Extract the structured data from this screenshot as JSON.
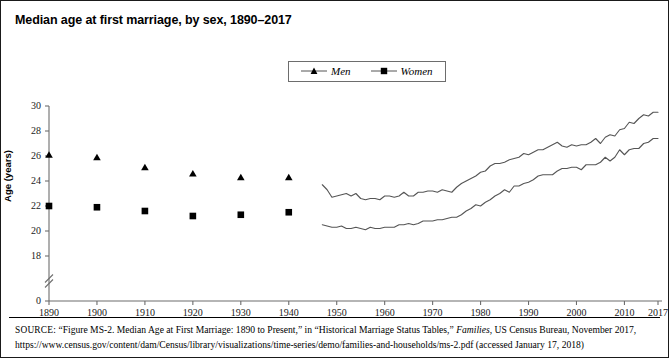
{
  "figure": {
    "title": "Median age at first marriage, by sex, 1890–2017",
    "ylabel": "Age (years)",
    "source_prefix": "SOURCE:",
    "source_text_1": " “Figure MS-2. Median Age at First Marriage: 1890 to Present,” in “Historical Marriage Status Tables,” ",
    "source_italic": "Families",
    "source_text_2": ", US Census Bureau, November 2017, https://www.census.gov/content/dam/Census/library/visualizations/time-series/demo/families-and-households/ms-2.pdf (accessed January 17, 2018)"
  },
  "legend": {
    "position": "top-center",
    "items": [
      {
        "label": "Men",
        "marker": "triangle-marker"
      },
      {
        "label": "Women",
        "marker": "square-marker"
      }
    ]
  },
  "chart_data": {
    "type": "line",
    "title": "Median age at first marriage, by sex, 1890–2017",
    "xlabel": "",
    "ylabel": "Age (years)",
    "xlim": [
      1890,
      2017
    ],
    "ylim": [
      17.5,
      30.5
    ],
    "yticks": [
      0,
      18,
      20,
      22,
      24,
      26,
      28,
      30
    ],
    "xticks": [
      1890,
      1900,
      1910,
      1920,
      1930,
      1940,
      1950,
      1960,
      1970,
      1980,
      1990,
      2000,
      2010,
      2017
    ],
    "axis_break": true,
    "axis_break_between": [
      0,
      18
    ],
    "grid": false,
    "legend_position": "top-center",
    "series": [
      {
        "name": "Men",
        "marker": "triangle",
        "style": "markers-then-line",
        "markers": {
          "x": [
            1890,
            1900,
            1910,
            1920,
            1930,
            1940
          ],
          "y": [
            26.1,
            25.9,
            25.1,
            24.6,
            24.3,
            24.3
          ]
        },
        "line": {
          "x": [
            1947,
            1948,
            1949,
            1950,
            1951,
            1952,
            1953,
            1954,
            1955,
            1956,
            1957,
            1958,
            1959,
            1960,
            1961,
            1962,
            1963,
            1964,
            1965,
            1966,
            1967,
            1968,
            1969,
            1970,
            1971,
            1972,
            1973,
            1974,
            1975,
            1976,
            1977,
            1978,
            1979,
            1980,
            1981,
            1982,
            1983,
            1984,
            1985,
            1986,
            1987,
            1988,
            1989,
            1990,
            1991,
            1992,
            1993,
            1994,
            1995,
            1996,
            1997,
            1998,
            1999,
            2000,
            2001,
            2002,
            2003,
            2004,
            2005,
            2006,
            2007,
            2008,
            2009,
            2010,
            2011,
            2012,
            2013,
            2014,
            2015,
            2016,
            2017
          ],
          "y": [
            23.7,
            23.3,
            22.7,
            22.8,
            22.9,
            23.0,
            22.8,
            23.0,
            22.6,
            22.5,
            22.6,
            22.6,
            22.5,
            22.8,
            22.8,
            22.7,
            22.8,
            23.1,
            22.8,
            22.8,
            23.1,
            23.1,
            23.2,
            23.2,
            23.1,
            23.3,
            23.2,
            23.1,
            23.5,
            23.8,
            24.0,
            24.2,
            24.4,
            24.7,
            24.8,
            25.2,
            25.4,
            25.4,
            25.5,
            25.7,
            25.8,
            25.9,
            26.2,
            26.1,
            26.3,
            26.5,
            26.5,
            26.7,
            26.9,
            27.1,
            26.8,
            26.7,
            26.9,
            26.8,
            26.9,
            26.9,
            27.1,
            27.4,
            27.0,
            27.5,
            27.7,
            27.6,
            28.1,
            28.2,
            28.7,
            28.6,
            29.0,
            29.3,
            29.2,
            29.5,
            29.5
          ]
        }
      },
      {
        "name": "Women",
        "marker": "square",
        "style": "markers-then-line",
        "markers": {
          "x": [
            1890,
            1900,
            1910,
            1920,
            1930,
            1940
          ],
          "y": [
            22.0,
            21.9,
            21.6,
            21.2,
            21.3,
            21.5
          ]
        },
        "line": {
          "x": [
            1947,
            1948,
            1949,
            1950,
            1951,
            1952,
            1953,
            1954,
            1955,
            1956,
            1957,
            1958,
            1959,
            1960,
            1961,
            1962,
            1963,
            1964,
            1965,
            1966,
            1967,
            1968,
            1969,
            1970,
            1971,
            1972,
            1973,
            1974,
            1975,
            1976,
            1977,
            1978,
            1979,
            1980,
            1981,
            1982,
            1983,
            1984,
            1985,
            1986,
            1987,
            1988,
            1989,
            1990,
            1991,
            1992,
            1993,
            1994,
            1995,
            1996,
            1997,
            1998,
            1999,
            2000,
            2001,
            2002,
            2003,
            2004,
            2005,
            2006,
            2007,
            2008,
            2009,
            2010,
            2011,
            2012,
            2013,
            2014,
            2015,
            2016,
            2017
          ],
          "y": [
            20.5,
            20.4,
            20.3,
            20.3,
            20.4,
            20.2,
            20.2,
            20.3,
            20.2,
            20.1,
            20.3,
            20.2,
            20.2,
            20.3,
            20.3,
            20.3,
            20.5,
            20.5,
            20.6,
            20.5,
            20.6,
            20.8,
            20.8,
            20.8,
            20.9,
            20.9,
            21.0,
            21.1,
            21.1,
            21.3,
            21.6,
            21.8,
            22.1,
            22.0,
            22.3,
            22.5,
            22.8,
            23.0,
            23.3,
            23.1,
            23.6,
            23.6,
            23.8,
            23.9,
            24.1,
            24.4,
            24.5,
            24.5,
            24.5,
            24.8,
            25.0,
            25.0,
            25.1,
            25.1,
            24.9,
            25.3,
            25.3,
            25.3,
            25.5,
            25.9,
            25.6,
            25.9,
            26.5,
            26.1,
            26.5,
            26.6,
            26.6,
            27.0,
            27.1,
            27.4,
            27.4
          ]
        }
      }
    ]
  }
}
